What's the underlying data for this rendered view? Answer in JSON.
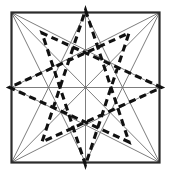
{
  "figure": {
    "canvas": {
      "width": 171,
      "height": 173,
      "background": "#ffffff"
    },
    "square": {
      "left": 11.5,
      "top": 12.5,
      "right": 159.5,
      "bottom": 162.5,
      "stroke": "#2b2b2b",
      "stroke_width": 2.2
    },
    "styles": {
      "thin_stroke": "#6e6e6e",
      "thin_width": 0.9,
      "dashed_stroke": "#111111",
      "dashed_width": 3.1,
      "dash_pattern": "7,4.5"
    },
    "key_points": {
      "corner_top_left": [
        11.5,
        12.5
      ],
      "corner_top_right": [
        159.5,
        12.5
      ],
      "corner_bottom_right": [
        159.5,
        162.5
      ],
      "corner_bottom_left": [
        11.5,
        162.5
      ],
      "mid_top": [
        85.5,
        12.5
      ],
      "mid_right": [
        159.5,
        87.5
      ],
      "mid_bottom": [
        85.5,
        162.5
      ],
      "mid_left": [
        11.5,
        87.5
      ],
      "center": [
        85.5,
        87.5
      ]
    },
    "thin_lines": [
      {
        "name": "diagonal-tl-br",
        "x1": 11.5,
        "y1": 12.5,
        "x2": 159.5,
        "y2": 162.5
      },
      {
        "name": "diagonal-tr-bl",
        "x1": 159.5,
        "y1": 12.5,
        "x2": 11.5,
        "y2": 162.5
      },
      {
        "name": "midline-horizontal",
        "x1": 11.5,
        "y1": 87.5,
        "x2": 159.5,
        "y2": 87.5
      },
      {
        "name": "midline-vertical",
        "x1": 85.5,
        "y1": 12.5,
        "x2": 85.5,
        "y2": 162.5
      },
      {
        "name": "tl-to-mid-right",
        "x1": 11.5,
        "y1": 12.5,
        "x2": 159.5,
        "y2": 87.5
      },
      {
        "name": "tl-to-mid-bottom",
        "x1": 11.5,
        "y1": 12.5,
        "x2": 85.5,
        "y2": 162.5
      },
      {
        "name": "tr-to-mid-left",
        "x1": 159.5,
        "y1": 12.5,
        "x2": 11.5,
        "y2": 87.5
      },
      {
        "name": "tr-to-mid-bottom",
        "x1": 159.5,
        "y1": 12.5,
        "x2": 85.5,
        "y2": 162.5
      },
      {
        "name": "br-to-mid-left",
        "x1": 159.5,
        "y1": 162.5,
        "x2": 11.5,
        "y2": 87.5
      },
      {
        "name": "br-to-mid-top",
        "x1": 159.5,
        "y1": 162.5,
        "x2": 85.5,
        "y2": 12.5
      },
      {
        "name": "bl-to-mid-right",
        "x1": 11.5,
        "y1": 162.5,
        "x2": 159.5,
        "y2": 87.5
      },
      {
        "name": "bl-to-mid-top",
        "x1": 11.5,
        "y1": 162.5,
        "x2": 85.5,
        "y2": 12.5
      }
    ],
    "dashed_star": {
      "name": "octagram-overlay",
      "vertices": [
        [
          85.5,
          10.0
        ],
        [
          129.0,
          33.0
        ],
        [
          161.5,
          87.5
        ],
        [
          129.0,
          142.0
        ],
        [
          85.5,
          165.0
        ],
        [
          42.0,
          142.0
        ],
        [
          9.5,
          87.5
        ],
        [
          42.0,
          33.0
        ]
      ],
      "step": 3,
      "closed": true
    }
  }
}
